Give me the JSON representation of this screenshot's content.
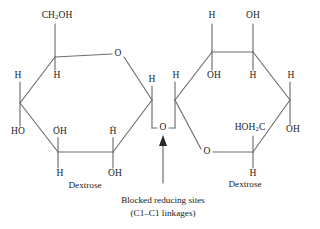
{
  "diagram": {
    "title_visible": false,
    "type": "chemical-structure",
    "description_label": "disaccharide-two-pyranose-rings",
    "stroke_color": "#6e6e6e",
    "text_color": "#1a1a1a",
    "background": "#ffffff"
  },
  "left_ring": {
    "name_label": "Dextrose",
    "name_pos": {
      "x": 85,
      "y": 185
    },
    "vertices": {
      "c5": {
        "x": 55,
        "y": 57
      },
      "ring_o": {
        "x": 118,
        "y": 54
      },
      "c1": {
        "x": 152,
        "y": 100
      },
      "c2": {
        "x": 113,
        "y": 152
      },
      "c3": {
        "x": 58,
        "y": 152
      },
      "c4": {
        "x": 20,
        "y": 103
      }
    },
    "substituents": [
      {
        "id": "ch2oh",
        "text": "CH2OH",
        "html": "CH<sub>2</sub>OH",
        "x": 57,
        "y": 16,
        "attach": "c5",
        "direction": "up"
      },
      {
        "id": "h-c5",
        "text": "H",
        "x": 57,
        "y": 76,
        "attach": "c5",
        "direction": "down"
      },
      {
        "id": "h-c4",
        "text": "H",
        "x": 18,
        "y": 76,
        "attach": "c4",
        "direction": "up"
      },
      {
        "id": "ho-c4",
        "text": "HO",
        "x": 18,
        "y": 132,
        "attach": "c4",
        "direction": "down"
      },
      {
        "id": "oh-c3",
        "text": "OH",
        "x": 60,
        "y": 132,
        "attach": "c3",
        "direction": "up"
      },
      {
        "id": "h-c3",
        "text": "H",
        "x": 60,
        "y": 174,
        "attach": "c3",
        "direction": "down"
      },
      {
        "id": "h-c2",
        "text": "H",
        "x": 113,
        "y": 132,
        "attach": "c2",
        "direction": "up"
      },
      {
        "id": "oh-c2",
        "text": "OH",
        "x": 115,
        "y": 174,
        "attach": "c2",
        "direction": "down"
      },
      {
        "id": "h-c1",
        "text": "H",
        "x": 152,
        "y": 80,
        "attach": "c1",
        "direction": "up"
      }
    ],
    "ring_o_label": "O"
  },
  "right_ring": {
    "name_label": "Dextrose",
    "name_pos": {
      "x": 245,
      "y": 184
    },
    "vertices": {
      "c3": {
        "x": 212,
        "y": 52
      },
      "c2": {
        "x": 253,
        "y": 52
      },
      "c1": {
        "x": 290,
        "y": 100
      },
      "c5": {
        "x": 253,
        "y": 152
      },
      "ring_o": {
        "x": 207,
        "y": 152
      },
      "c4": {
        "x": 175,
        "y": 100
      }
    },
    "substituents": [
      {
        "id": "h-c3-top",
        "text": "H",
        "x": 212,
        "y": 16,
        "attach": "c3",
        "direction": "up"
      },
      {
        "id": "oh-c2-top",
        "text": "OH",
        "x": 253,
        "y": 16,
        "attach": "c2",
        "direction": "up"
      },
      {
        "id": "oh-c3",
        "text": "OH",
        "x": 214,
        "y": 76,
        "attach": "c3",
        "direction": "down"
      },
      {
        "id": "h-c2",
        "text": "H",
        "x": 253,
        "y": 76,
        "attach": "c2",
        "direction": "down"
      },
      {
        "id": "h-c4",
        "text": "H",
        "x": 176,
        "y": 76,
        "attach": "c4",
        "direction": "up"
      },
      {
        "id": "h-c1",
        "text": "H",
        "x": 291,
        "y": 76,
        "attach": "c1",
        "direction": "up"
      },
      {
        "id": "oh-c1",
        "text": "OH",
        "x": 293,
        "y": 130,
        "attach": "c1",
        "direction": "down"
      },
      {
        "id": "hoh2c",
        "text": "HOH2C",
        "html": "HOH<sub>2</sub>C",
        "x": 250,
        "y": 128,
        "attach": "c5",
        "direction": "up"
      },
      {
        "id": "h-c5",
        "text": "H",
        "x": 253,
        "y": 174,
        "attach": "c5",
        "direction": "down"
      }
    ],
    "ring_o_label": "O"
  },
  "linkage": {
    "bridge_o_label": "O",
    "bridge_o_pos": {
      "x": 163,
      "y": 128
    },
    "arrow": {
      "from": {
        "x": 163,
        "y": 183
      },
      "to": {
        "x": 163,
        "y": 138
      }
    },
    "caption_line1": "Blocked reducing sites",
    "caption_line2": "(C1–C1 linkages)",
    "caption_pos": {
      "x": 163,
      "y": 200
    }
  }
}
